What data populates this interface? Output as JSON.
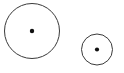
{
  "canvas": {
    "width": 124,
    "height": 73,
    "background_color": "#ffffff",
    "title": "Two Circles Diagram"
  },
  "style": {
    "stroke_color": "#3a3a3a",
    "stroke_width": 1,
    "fill_color": "#ffffff",
    "dot_color": "#111111"
  },
  "shapes": [
    {
      "name": "large-circle",
      "type": "circle",
      "cx": 32,
      "cy": 31,
      "r": 27.5,
      "dot_r": 2.2,
      "label": ""
    },
    {
      "name": "small-circle",
      "type": "circle",
      "cx": 97,
      "cy": 49.5,
      "r": 15.5,
      "dot_r": 2.1,
      "label": ""
    }
  ]
}
